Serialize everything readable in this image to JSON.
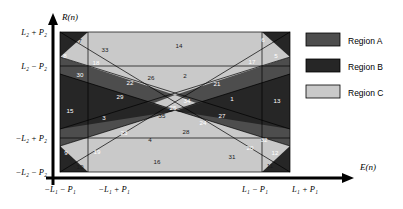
{
  "figure": {
    "title": "",
    "axes": {
      "y_axis_label": "R(n)",
      "x_axis_label": "E(n)",
      "y_ticks": [
        "L₂ + P₂",
        "L₂ − P₂",
        "−L₂ + P₂",
        "−L₂ − P₂"
      ],
      "x_ticks": [
        "−L₁ − P₁",
        "−L₁ + P₁",
        "L₁ − P₁",
        "L₁ + P₁"
      ]
    },
    "legend": {
      "items": [
        {
          "label": "Region A",
          "color": "#4d4d4d"
        },
        {
          "label": "Region B",
          "color": "#262626"
        },
        {
          "label": "Region C",
          "color": "#c9c9c9"
        }
      ]
    },
    "region_numbers": [
      {
        "n": "1",
        "x": 232,
        "y": 101,
        "tone": "light"
      },
      {
        "n": "2",
        "x": 185,
        "y": 78,
        "tone": "dark"
      },
      {
        "n": "3",
        "x": 104,
        "y": 120,
        "tone": "light"
      },
      {
        "n": "4",
        "x": 150,
        "y": 142,
        "tone": "dark"
      },
      {
        "n": "5",
        "x": 276,
        "y": 58,
        "tone": "light"
      },
      {
        "n": "6",
        "x": 263,
        "y": 42,
        "tone": "light"
      },
      {
        "n": "7",
        "x": 80,
        "y": 43,
        "tone": "dark"
      },
      {
        "n": "8",
        "x": 65,
        "y": 58,
        "tone": "light"
      },
      {
        "n": "9",
        "x": 66,
        "y": 155,
        "tone": "light"
      },
      {
        "n": "10",
        "x": 80,
        "y": 169,
        "tone": "dark"
      },
      {
        "n": "11",
        "x": 270,
        "y": 168,
        "tone": "dark"
      },
      {
        "n": "12",
        "x": 275,
        "y": 155,
        "tone": "light"
      },
      {
        "n": "13",
        "x": 277,
        "y": 103,
        "tone": "light"
      },
      {
        "n": "14",
        "x": 179,
        "y": 48,
        "tone": "dark"
      },
      {
        "n": "15",
        "x": 70,
        "y": 113,
        "tone": "light"
      },
      {
        "n": "16",
        "x": 157,
        "y": 164,
        "tone": "dark"
      },
      {
        "n": "17",
        "x": 252,
        "y": 64,
        "tone": "light"
      },
      {
        "n": "18",
        "x": 96,
        "y": 65,
        "tone": "light"
      },
      {
        "n": "19",
        "x": 97,
        "y": 154,
        "tone": "light"
      },
      {
        "n": "20",
        "x": 250,
        "y": 150,
        "tone": "light"
      },
      {
        "n": "21",
        "x": 217,
        "y": 86,
        "tone": "light"
      },
      {
        "n": "22",
        "x": 130,
        "y": 85,
        "tone": "light"
      },
      {
        "n": "23",
        "x": 124,
        "y": 135,
        "tone": "light"
      },
      {
        "n": "24",
        "x": 203,
        "y": 125,
        "tone": "light"
      },
      {
        "n": "25",
        "x": 173,
        "y": 110,
        "tone": "light"
      },
      {
        "n": "26",
        "x": 151,
        "y": 80,
        "tone": "dark"
      },
      {
        "n": "27",
        "x": 222,
        "y": 118,
        "tone": "light"
      },
      {
        "n": "28",
        "x": 186,
        "y": 134,
        "tone": "dark"
      },
      {
        "n": "29",
        "x": 120,
        "y": 99,
        "tone": "light"
      },
      {
        "n": "30",
        "x": 80,
        "y": 77,
        "tone": "light"
      },
      {
        "n": "31",
        "x": 232,
        "y": 159,
        "tone": "dark"
      },
      {
        "n": "32",
        "x": 264,
        "y": 142,
        "tone": "light"
      },
      {
        "n": "33",
        "x": 105,
        "y": 52,
        "tone": "dark"
      },
      {
        "n": "34",
        "x": 187,
        "y": 103,
        "tone": "light"
      },
      {
        "n": "35",
        "x": 162,
        "y": 118,
        "tone": "dark"
      }
    ],
    "colors": {
      "region_a": "#4d4d4d",
      "region_b": "#262626",
      "region_c": "#c9c9c9",
      "outline": "#000000",
      "background": "#ffffff"
    }
  }
}
